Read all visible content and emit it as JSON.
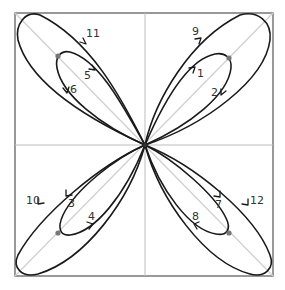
{
  "diagram": {
    "labels": {
      "l1": "1",
      "l2": "2",
      "l3": "3",
      "l4": "4",
      "l5": "5",
      "l6": "6",
      "l7": "7",
      "l8": "8",
      "l9": "9",
      "l10": "10",
      "l11": "11",
      "l12": "12"
    },
    "colors": {
      "curve": "#1a1a1a",
      "frame": "#555555",
      "guide_lines": "#cfcfcf",
      "dots": "#777777"
    }
  }
}
